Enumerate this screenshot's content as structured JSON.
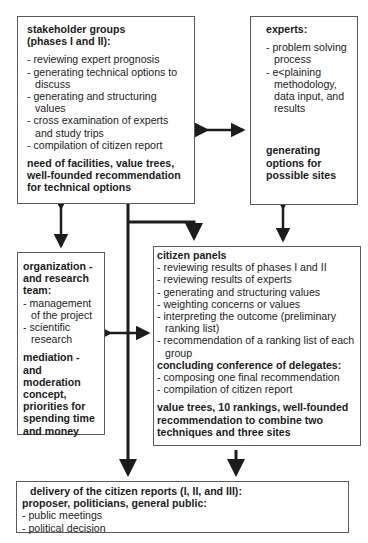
{
  "stakeholder": {
    "title1": "stakeholder groups",
    "title2": "(phases I and II):",
    "items": [
      "- reviewing expert prognosis",
      "- generating technical options to discuss",
      "- generating and structuring values",
      "- cross examination of experts and study trips",
      "- compilation of citizen report"
    ],
    "outcome": "need of facilities, value trees, well-founded recommendation for technical options"
  },
  "experts": {
    "title": "experts:",
    "items": [
      "- problem solving process",
      "- e<plaining methodology, data input, and results"
    ],
    "outcome": "generating options for possible sites"
  },
  "organization": {
    "title": "organization - and research team:",
    "items": [
      "- management of the project",
      "- scientific research"
    ],
    "outcome": "mediation - and moderation concept, priorities for spending time and money"
  },
  "citizen_panels": {
    "title": "citizen panels",
    "items": [
      "- reviewing results of phases I and II",
      "- reviewing results of experts",
      "- generating and structuring values",
      "- weighting concerns or values",
      "- interpreting the outcome (preliminary ranking list)",
      "- recommendation of a ranking list of each group"
    ],
    "subtitle": "concluding conference of delegates:",
    "sub_items": [
      "- composing one final recommendation",
      "- compilation of citizen report"
    ],
    "outcome": "value trees, 10 rankings, well-founded recommendation to combine two techniques and three sites"
  },
  "delivery": {
    "title1": "delivery of the citizen reports (I, II, and III):",
    "title2": "proposer, politicians, general public:",
    "items": [
      "- public meetings",
      "- political decision"
    ]
  }
}
